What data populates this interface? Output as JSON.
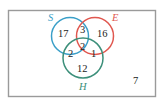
{
  "diagram": {
    "type": "venn",
    "universe_count": "7",
    "sets": [
      {
        "name": "S",
        "color": "#3a9fc8"
      },
      {
        "name": "E",
        "color": "#e0574f"
      },
      {
        "name": "H",
        "color": "#3c8f7a"
      }
    ],
    "regions": {
      "S_only": "17",
      "E_only": "16",
      "H_only": "12",
      "S_and_E_only": "3",
      "S_and_H_only": "2",
      "E_and_H_only": "1",
      "S_E_H": "2"
    }
  }
}
